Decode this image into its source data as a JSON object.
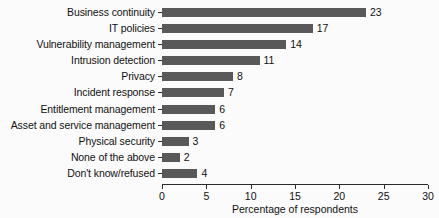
{
  "chart_data": {
    "type": "bar",
    "orientation": "horizontal",
    "title": "",
    "xlabel": "Percentage of respondents",
    "ylabel": "",
    "xlim": [
      0,
      30
    ],
    "xticks": [
      0,
      5,
      10,
      15,
      20,
      25,
      30
    ],
    "grid": false,
    "legend": false,
    "bar_color": "#595959",
    "background_color": "#fbfbfb",
    "axis_color": "#2b2b2b",
    "show_value_labels": true,
    "categories": [
      "Business continuity",
      "IT policies",
      "Vulnerability management",
      "Intrusion detection",
      "Privacy",
      "Incident response",
      "Entitlement management",
      "Asset and service management",
      "Physical security",
      "None of the above",
      "Don't know/refused"
    ],
    "values": [
      23,
      17,
      14,
      11,
      8,
      7,
      6,
      6,
      3,
      2,
      4
    ],
    "value_labels": [
      "23",
      "17",
      "14",
      "11",
      "8",
      "7",
      "6",
      "6",
      "3",
      "2",
      "4"
    ]
  }
}
